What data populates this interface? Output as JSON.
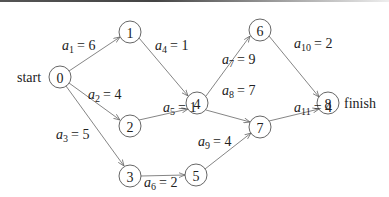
{
  "diagram": {
    "type": "activity-on-edge network",
    "start_label": "start",
    "finish_label": "finish",
    "nodes": [
      {
        "id": "0",
        "x": 60,
        "y": 77
      },
      {
        "id": "1",
        "x": 130,
        "y": 32
      },
      {
        "id": "2",
        "x": 130,
        "y": 126
      },
      {
        "id": "3",
        "x": 130,
        "y": 176
      },
      {
        "id": "4",
        "x": 197,
        "y": 103
      },
      {
        "id": "5",
        "x": 196,
        "y": 175
      },
      {
        "id": "6",
        "x": 260,
        "y": 30
      },
      {
        "id": "7",
        "x": 260,
        "y": 127
      },
      {
        "id": "8",
        "x": 328,
        "y": 103
      }
    ],
    "edges": [
      {
        "name": "a",
        "sub": "1",
        "value": "6",
        "from": "0",
        "to": "1",
        "text": "= 6"
      },
      {
        "name": "a",
        "sub": "2",
        "value": "4",
        "from": "0",
        "to": "2",
        "text": "= 4"
      },
      {
        "name": "a",
        "sub": "3",
        "value": "5",
        "from": "0",
        "to": "3",
        "text": "= 5"
      },
      {
        "name": "a",
        "sub": "4",
        "value": "1",
        "from": "1",
        "to": "4",
        "text": "= 1"
      },
      {
        "name": "a",
        "sub": "5",
        "value": "1",
        "from": "2",
        "to": "4",
        "text": "= 1"
      },
      {
        "name": "a",
        "sub": "6",
        "value": "2",
        "from": "3",
        "to": "5",
        "text": "= 2"
      },
      {
        "name": "a",
        "sub": "7",
        "value": "9",
        "from": "4",
        "to": "6",
        "text": "= 9"
      },
      {
        "name": "a",
        "sub": "8",
        "value": "7",
        "from": "4",
        "to": "7",
        "text": "= 7"
      },
      {
        "name": "a",
        "sub": "9",
        "value": "4",
        "from": "5",
        "to": "7",
        "text": "= 4"
      },
      {
        "name": "a",
        "sub": "10",
        "value": "2",
        "from": "6",
        "to": "8",
        "text": "= 2"
      },
      {
        "name": "a",
        "sub": "11",
        "value": "4",
        "from": "7",
        "to": "8",
        "text": "= 4"
      }
    ]
  }
}
